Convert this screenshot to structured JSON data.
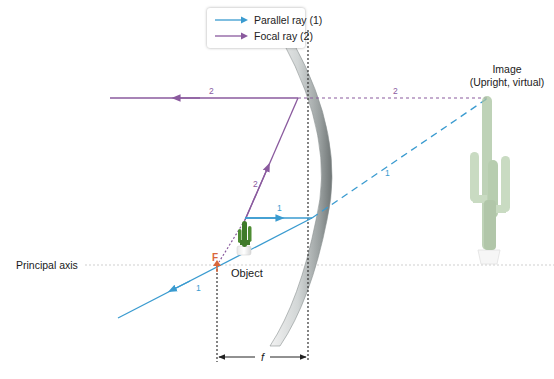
{
  "legend": {
    "items": [
      {
        "label": "Parallel ray (1)",
        "color": "#3a9bd0"
      },
      {
        "label": "Focal ray (2)",
        "color": "#8a5a9e"
      }
    ]
  },
  "labels": {
    "image_title": "Image",
    "image_subtitle": "(Upright, virtual)",
    "object": "Object",
    "principal_axis": "Principal axis",
    "focal_point": "F",
    "focal_length": "f"
  },
  "ray_numbers": {
    "focal_reflected": "2",
    "focal_virtual": "2",
    "focal_incident": "2",
    "parallel_incident": "1",
    "parallel_virtual": "1",
    "parallel_reflected": "1"
  },
  "colors": {
    "parallel_ray": "#3a9bd0",
    "focal_ray": "#8a5a9e",
    "focal_point": "#d9663a",
    "axis": "#cfcfcf",
    "guide": "#333333"
  }
}
